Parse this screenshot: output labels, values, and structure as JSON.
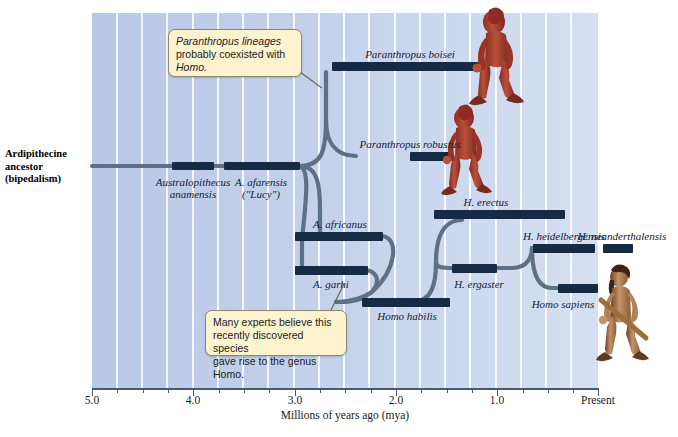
{
  "figure": {
    "domain": "scientific-diagram",
    "root_label": "Ardipithecine ancestor (bipedalism)",
    "axis": {
      "title": "Millions of years ago (mya)",
      "tick_labels": [
        "5.0",
        "4.0",
        "3.0",
        "2.0",
        "1.0",
        "Present"
      ],
      "tick_values": [
        5.0,
        4.0,
        3.0,
        2.0,
        1.0,
        0.0
      ],
      "minor_step": 0.25,
      "range": [
        5.0,
        0.0
      ]
    },
    "colors": {
      "panel_left": "#b9c8e8",
      "panel_right": "#d6e0f2",
      "gridline": "#ffffff",
      "bar_dark": "#152b45",
      "branch": "#5d7186",
      "callout_fill": "#fdf3cf",
      "callout_border": "#8a8a72",
      "axis": "#4a5a72",
      "hominin_red": "#a8372a",
      "hominin_skin": "#c08a5e"
    },
    "callouts": [
      {
        "id": "paranthropus-note",
        "lines": [
          "Paranthropus lineages",
          "probably coexisted with",
          "Homo."
        ],
        "italic_words": [
          "Paranthropus",
          "Homo"
        ],
        "points_to": "paranthropus-branch"
      },
      {
        "id": "garhi-note",
        "lines": [
          "Many experts believe this",
          "recently discovered species",
          "gave rise to the genus Homo."
        ],
        "italic_words": [
          "Homo"
        ],
        "points_to": "A. garhi"
      }
    ],
    "species": [
      {
        "name": "Australopithecus anamensis",
        "label_lines": [
          "Australopithecus",
          "anamensis"
        ],
        "range_mya": [
          4.2,
          3.9
        ],
        "row": 166
      },
      {
        "name": "A. afarensis",
        "label_lines": [
          "A. afarensis",
          "(\"Lucy\")"
        ],
        "range_mya": [
          3.7,
          2.95
        ],
        "row": 166
      },
      {
        "name": "Paranthropus boisei",
        "label_lines": [
          "Paranthropus boisei"
        ],
        "range_mya": [
          2.65,
          1.15
        ],
        "row": 66
      },
      {
        "name": "Paranthropus robustus",
        "label_lines": [
          "Paranthropus robustus"
        ],
        "range_mya": [
          1.95,
          1.55
        ],
        "row": 156
      },
      {
        "name": "A. africanus",
        "label_lines": [
          "A. africanus"
        ],
        "range_mya": [
          3.0,
          2.35
        ],
        "row": 236
      },
      {
        "name": "A. garhi",
        "label_lines": [
          "A. garhi"
        ],
        "range_mya": [
          2.95,
          2.35
        ],
        "row": 270
      },
      {
        "name": "Homo habilis",
        "label_lines": [
          "Homo habilis"
        ],
        "range_mya": [
          2.2,
          1.6
        ],
        "row": 302
      },
      {
        "name": "H. ergaster",
        "label_lines": [
          "H. ergaster"
        ],
        "range_mya": [
          1.75,
          1.45
        ],
        "row": 268
      },
      {
        "name": "H. erectus",
        "label_lines": [
          "H. erectus"
        ],
        "range_mya": [
          1.85,
          0.9
        ],
        "row": 214
      },
      {
        "name": "H. heidelbergensis",
        "label_lines": [
          "H. heidelbergensis"
        ],
        "range_mya": [
          0.75,
          0.35
        ],
        "row": 248
      },
      {
        "name": "H. neanderthalensis",
        "label_lines": [
          "H. neanderthalensis"
        ],
        "range_mya": [
          0.28,
          0.14
        ],
        "row": 248
      },
      {
        "name": "Homo sapiens",
        "label_lines": [
          "Homo sapiens"
        ],
        "range_mya": [
          0.4,
          0.0
        ],
        "row": 288
      }
    ],
    "hominin_figures": [
      {
        "id": "paranthropus-boisei-figure",
        "caption": "Paranthropus boisei reconstruction"
      },
      {
        "id": "paranthropus-robustus-figure",
        "caption": "Paranthropus robustus reconstruction"
      },
      {
        "id": "homo-sapiens-figure",
        "caption": "Homo sapiens reconstruction"
      }
    ]
  }
}
